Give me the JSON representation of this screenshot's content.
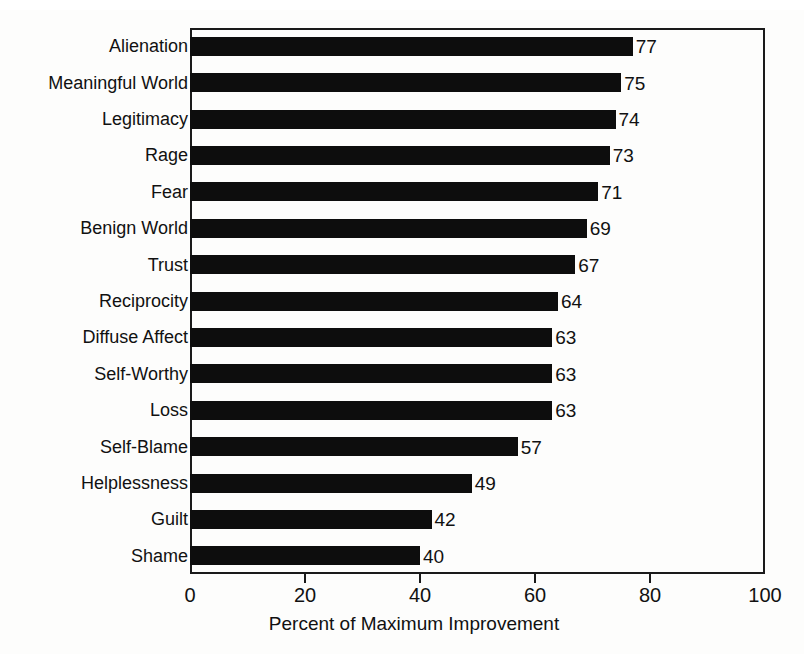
{
  "chart_data": {
    "type": "bar",
    "orientation": "horizontal",
    "title": "",
    "xlabel": "Percent of Maximum Improvement",
    "ylabel": "",
    "xlim": [
      0,
      100
    ],
    "xticks": [
      0,
      20,
      40,
      60,
      80,
      100
    ],
    "grid": false,
    "legend": null,
    "bar_color": "#0d0d0d",
    "background_color": "#fdfdfc",
    "show_value_labels": true,
    "categories": [
      "Alienation",
      "Meaningful World",
      "Legitimacy",
      "Rage",
      "Fear",
      "Benign World",
      "Trust",
      "Reciprocity",
      "Diffuse Affect",
      "Self-Worthy",
      "Loss",
      "Self-Blame",
      "Helplessness",
      "Guilt",
      "Shame"
    ],
    "values": [
      77,
      75,
      74,
      73,
      71,
      69,
      67,
      64,
      63,
      63,
      63,
      57,
      49,
      42,
      40
    ],
    "value_labels": [
      "77",
      "75",
      "74",
      "73",
      "71",
      "69",
      "67",
      "64",
      "63",
      "63",
      "63",
      "57",
      "49",
      "42",
      "40"
    ],
    "xtick_labels": [
      "0",
      "20",
      "40",
      "60",
      "80",
      "100"
    ]
  }
}
